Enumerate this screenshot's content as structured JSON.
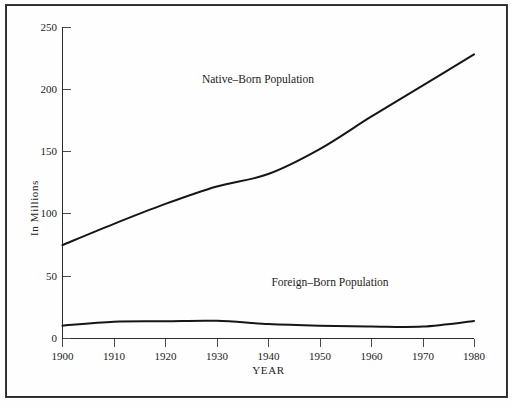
{
  "chart_data": {
    "type": "line",
    "title": "",
    "xlabel": "YEAR",
    "ylabel": "In Millions",
    "x": [
      1900,
      1910,
      1920,
      1930,
      1940,
      1950,
      1960,
      1970,
      1980
    ],
    "xlim": [
      1900,
      1980
    ],
    "ylim": [
      0,
      250
    ],
    "xticks": [
      "1900",
      "1910",
      "1920",
      "1930",
      "1940",
      "1950",
      "1960",
      "1970",
      "1980"
    ],
    "yticks": [
      "0",
      "50",
      "100",
      "150",
      "200",
      "250"
    ],
    "grid": false,
    "legend_position": "inline-annotation",
    "series": [
      {
        "name": "Native-Born Population",
        "label": "Native–Born Population",
        "color": "#161616",
        "values": [
          75,
          92,
          108,
          122,
          132,
          152,
          178,
          203,
          228
        ]
      },
      {
        "name": "Foreign-Born Population",
        "label": "Foreign–Born Population",
        "color": "#161616",
        "values": [
          10.3,
          13.5,
          13.9,
          14.2,
          11.6,
          10.3,
          9.7,
          9.6,
          14.1
        ]
      }
    ],
    "annotations": [
      {
        "text": "Native–Born Population",
        "x": 1938,
        "y": 205
      },
      {
        "text": "Foreign–Born Population",
        "x": 1952,
        "y": 42
      }
    ]
  },
  "frame": {
    "border_color": "#2a2a2a",
    "background": "#fefefe"
  }
}
